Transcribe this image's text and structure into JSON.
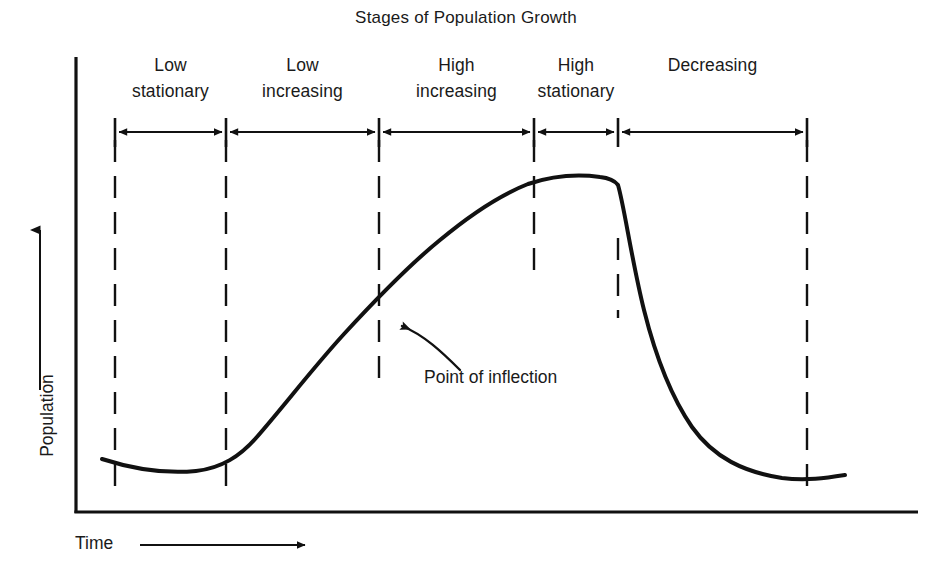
{
  "chart_data": {
    "type": "line",
    "title": "Stages of Population Growth",
    "xlabel": "Time",
    "ylabel": "Population",
    "grid": false,
    "legend": false,
    "annotations": [
      {
        "name": "point-of-inflection",
        "text": "Point of inflection",
        "target_x": 0.43,
        "target_y": 0.53
      }
    ],
    "stages": [
      {
        "line1": "Low",
        "line2": "stationary",
        "start": 0.0,
        "end": 0.16
      },
      {
        "line1": "Low",
        "line2": "increasing",
        "start": 0.16,
        "end": 0.38
      },
      {
        "line1": "High",
        "line2": "increasing",
        "start": 0.38,
        "end": 0.61
      },
      {
        "line1": "High",
        "line2": "stationary",
        "start": 0.61,
        "end": 0.73
      },
      {
        "line1": "",
        "line2": "Decreasing",
        "start": 0.73,
        "end": 1.0
      }
    ],
    "x": [
      0.0,
      0.05,
      0.1,
      0.16,
      0.22,
      0.28,
      0.34,
      0.38,
      0.43,
      0.49,
      0.55,
      0.61,
      0.66,
      0.7,
      0.73,
      0.745,
      0.78,
      0.83,
      0.88,
      0.93,
      1.0
    ],
    "y": [
      0.115,
      0.092,
      0.082,
      0.09,
      0.13,
      0.205,
      0.31,
      0.395,
      0.53,
      0.68,
      0.8,
      0.88,
      0.92,
      0.93,
      0.925,
      0.905,
      0.64,
      0.42,
      0.26,
      0.175,
      0.135
    ],
    "xlim": [
      0,
      1
    ],
    "ylim": [
      0,
      1
    ],
    "series_name": "Population",
    "curve_color": "#111111"
  },
  "axes": {
    "y_arrow": "up-arrow",
    "x_arrow": "right-arrow"
  },
  "colors": {
    "ink": "#111111",
    "background": "#ffffff"
  }
}
